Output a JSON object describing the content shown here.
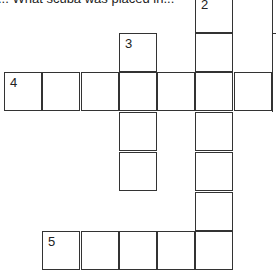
{
  "clue_fragment": "... What scuba was placed in...",
  "cells": [
    {
      "x": 195,
      "y": -6,
      "num": "2"
    },
    {
      "x": 195,
      "y": 33,
      "num": ""
    },
    {
      "x": 119,
      "y": 33,
      "num": "3"
    },
    {
      "x": 4,
      "y": 72,
      "num": "4"
    },
    {
      "x": 42,
      "y": 72,
      "num": ""
    },
    {
      "x": 81,
      "y": 72,
      "num": ""
    },
    {
      "x": 119,
      "y": 72,
      "num": ""
    },
    {
      "x": 157,
      "y": 72,
      "num": ""
    },
    {
      "x": 195,
      "y": 72,
      "num": ""
    },
    {
      "x": 234,
      "y": 72,
      "num": ""
    },
    {
      "x": 119,
      "y": 112,
      "num": ""
    },
    {
      "x": 119,
      "y": 152,
      "num": ""
    },
    {
      "x": 195,
      "y": 112,
      "num": ""
    },
    {
      "x": 195,
      "y": 152,
      "num": ""
    },
    {
      "x": 195,
      "y": 192,
      "num": ""
    },
    {
      "x": 42,
      "y": 231,
      "num": "5"
    },
    {
      "x": 81,
      "y": 231,
      "num": ""
    },
    {
      "x": 119,
      "y": 231,
      "num": ""
    },
    {
      "x": 157,
      "y": 231,
      "num": ""
    },
    {
      "x": 195,
      "y": 231,
      "num": ""
    }
  ],
  "offscreen_edge": {
    "x": 272,
    "y_top": 0,
    "y_bottom": 112,
    "tick_y": 33
  }
}
